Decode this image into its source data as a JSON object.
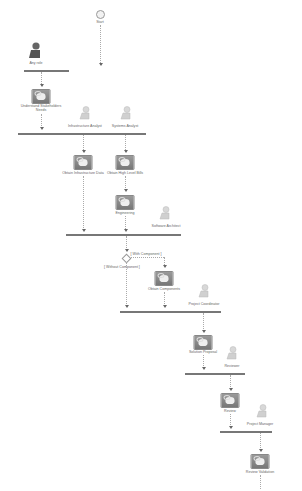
{
  "diagram": {
    "type": "activity-diagram",
    "start": {
      "label": "Start"
    },
    "roles": [
      {
        "id": "any-role",
        "label": "Any role",
        "style": "dark"
      },
      {
        "id": "infra-analyst",
        "label": "Infrastructure Analyst",
        "style": "light"
      },
      {
        "id": "systems-analyst",
        "label": "Systems Analyst",
        "style": "light"
      },
      {
        "id": "software-architect",
        "label": "Software Architect",
        "style": "light"
      },
      {
        "id": "project-coordinator",
        "label": "Project Coordinator",
        "style": "light"
      },
      {
        "id": "reviewer",
        "label": "Reviewer",
        "style": "light"
      },
      {
        "id": "project-manager",
        "label": "Project Manager",
        "style": "light"
      }
    ],
    "activities": [
      {
        "id": "understand",
        "label_line1": "Understand Stakeholders",
        "label_line2": "Needs"
      },
      {
        "id": "obtain-infra",
        "label": "Obtain Infrastructure Data"
      },
      {
        "id": "obtain-hl",
        "label": "Obtain High Level Bills"
      },
      {
        "id": "engineering",
        "label": "Engineering"
      },
      {
        "id": "obtain-components",
        "label": "Obtain Components"
      },
      {
        "id": "solution-proposal",
        "label": "Solution Proposal"
      },
      {
        "id": "review",
        "label": "Review"
      },
      {
        "id": "review-validation",
        "label": "Review Validation"
      }
    ],
    "guards": {
      "with": "[ With Component ]",
      "without": "[ Without Component ]"
    },
    "colors": {
      "bar": "#777777",
      "activity": "#888888",
      "role_dark": "#666666",
      "role_light": "#cccccc"
    }
  }
}
